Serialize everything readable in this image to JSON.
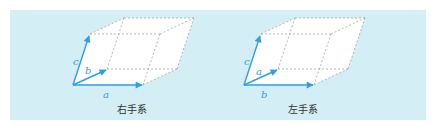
{
  "panel": {
    "background": "#d3eef5"
  },
  "colors": {
    "arrow": "#2f9ee3",
    "edge": "#9a9a9a",
    "face": "#ffffff"
  },
  "diagrams": [
    {
      "name": "right-handed",
      "caption": "右手系",
      "labels": {
        "x_axis": "a",
        "y_axis": "b",
        "z_axis": "c"
      }
    },
    {
      "name": "left-handed",
      "caption": "左手系",
      "labels": {
        "x_axis": "b",
        "y_axis": "a",
        "z_axis": "c"
      }
    }
  ]
}
